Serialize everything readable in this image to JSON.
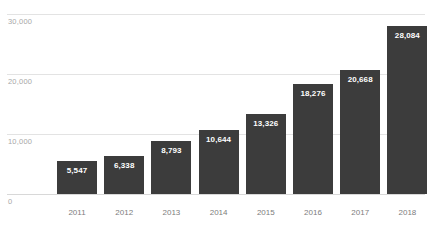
{
  "chart_data": {
    "type": "bar",
    "title": "",
    "subtitle": "",
    "xlabel": "",
    "ylabel": "",
    "categories": [
      "2011",
      "2012",
      "2013",
      "2014",
      "2015",
      "2016",
      "2017",
      "2018"
    ],
    "values": [
      5547,
      6338,
      8793,
      10644,
      13326,
      18276,
      20668,
      28084
    ],
    "value_labels": [
      "5,547",
      "6,338",
      "8,793",
      "10,644",
      "13,326",
      "18,276",
      "20,668",
      "28,084"
    ],
    "ylim": [
      0,
      30000
    ],
    "yticks": [
      0,
      10000,
      20000,
      30000
    ],
    "ytick_labels": [
      "0",
      "10,000",
      "20,000",
      "30,000"
    ],
    "grid": true,
    "legend": false,
    "legend_position": "none",
    "series": [
      {
        "name": "",
        "values": [
          5547,
          6338,
          8793,
          10644,
          13326,
          18276,
          20668,
          28084
        ]
      }
    ]
  },
  "colors": {
    "bar": "#3c3c3c",
    "gridline": "#e3e3e3",
    "baseline": "#d8d8d8",
    "value_label": "#ffffff",
    "axis_label": "#a8a8a8",
    "category_label": "#7d7d7d",
    "background": "#ffffff"
  }
}
